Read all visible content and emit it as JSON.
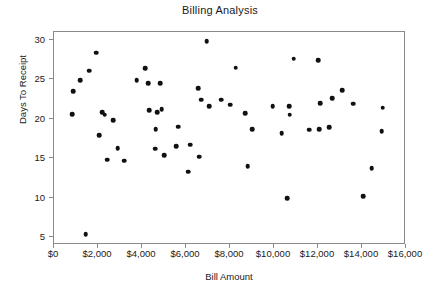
{
  "chart_data": {
    "type": "scatter",
    "title": "Billing Analysis",
    "xlabel": "Bill Amount",
    "ylabel": "Days To Receipt",
    "xlim": [
      0,
      16000
    ],
    "ylim": [
      4,
      31
    ],
    "grid": false,
    "legend": null,
    "xticks": [
      0,
      2000,
      4000,
      6000,
      8000,
      10000,
      12000,
      14000,
      16000
    ],
    "xticklabels": [
      "$0",
      "$2,000",
      "$4,000",
      "$6,000",
      "$8,000",
      "$10,000",
      "$12,000",
      "$14,000",
      "$16,000"
    ],
    "yticks": [
      5,
      10,
      15,
      20,
      25,
      30
    ],
    "yticklabels": [
      "5",
      "10",
      "15",
      "20",
      "25",
      "30"
    ],
    "marker": "filled-circle",
    "marker_color": "#111111",
    "points": [
      {
        "x": 820,
        "y": 20.6
      },
      {
        "x": 880,
        "y": 23.5
      },
      {
        "x": 1180,
        "y": 24.9
      },
      {
        "x": 1450,
        "y": 5.4
      },
      {
        "x": 1600,
        "y": 26.1
      },
      {
        "x": 1920,
        "y": 28.4
      },
      {
        "x": 2050,
        "y": 17.9
      },
      {
        "x": 2180,
        "y": 20.8
      },
      {
        "x": 2300,
        "y": 20.5
      },
      {
        "x": 2420,
        "y": 14.8
      },
      {
        "x": 2700,
        "y": 19.8
      },
      {
        "x": 2900,
        "y": 16.3
      },
      {
        "x": 3200,
        "y": 14.7
      },
      {
        "x": 3750,
        "y": 24.9
      },
      {
        "x": 4150,
        "y": 26.4
      },
      {
        "x": 4280,
        "y": 24.5
      },
      {
        "x": 4320,
        "y": 21.1
      },
      {
        "x": 4600,
        "y": 16.2
      },
      {
        "x": 4620,
        "y": 18.7
      },
      {
        "x": 4680,
        "y": 20.8
      },
      {
        "x": 4820,
        "y": 24.5
      },
      {
        "x": 4900,
        "y": 21.2
      },
      {
        "x": 5000,
        "y": 15.4
      },
      {
        "x": 5550,
        "y": 16.5
      },
      {
        "x": 5650,
        "y": 19.0
      },
      {
        "x": 6100,
        "y": 13.3
      },
      {
        "x": 6200,
        "y": 16.7
      },
      {
        "x": 6550,
        "y": 23.9
      },
      {
        "x": 6600,
        "y": 15.2
      },
      {
        "x": 6700,
        "y": 22.4
      },
      {
        "x": 6950,
        "y": 29.8
      },
      {
        "x": 7050,
        "y": 21.6
      },
      {
        "x": 7600,
        "y": 22.4
      },
      {
        "x": 8000,
        "y": 21.8
      },
      {
        "x": 8250,
        "y": 26.5
      },
      {
        "x": 8700,
        "y": 20.7
      },
      {
        "x": 8800,
        "y": 14.0
      },
      {
        "x": 9000,
        "y": 18.7
      },
      {
        "x": 9950,
        "y": 21.6
      },
      {
        "x": 10350,
        "y": 18.2
      },
      {
        "x": 10600,
        "y": 9.9
      },
      {
        "x": 10700,
        "y": 21.6
      },
      {
        "x": 10720,
        "y": 20.5
      },
      {
        "x": 10900,
        "y": 27.6
      },
      {
        "x": 11600,
        "y": 18.6
      },
      {
        "x": 12000,
        "y": 27.4
      },
      {
        "x": 12050,
        "y": 18.7
      },
      {
        "x": 12100,
        "y": 22.0
      },
      {
        "x": 12500,
        "y": 18.9
      },
      {
        "x": 12650,
        "y": 22.6
      },
      {
        "x": 13100,
        "y": 23.6
      },
      {
        "x": 13600,
        "y": 21.9
      },
      {
        "x": 14050,
        "y": 10.2
      },
      {
        "x": 14450,
        "y": 13.7
      },
      {
        "x": 14900,
        "y": 18.4
      },
      {
        "x": 14950,
        "y": 21.4
      }
    ]
  }
}
